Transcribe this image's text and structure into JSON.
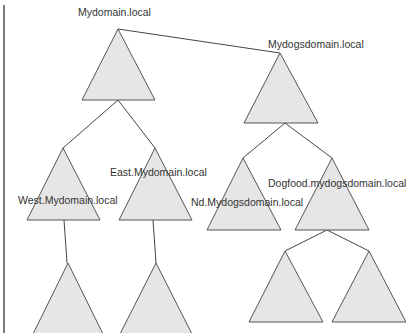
{
  "diagram": {
    "colors": {
      "triangle_fill": "#e6e6e6",
      "triangle_stroke": "#555555",
      "connector": "#444444",
      "text": "#333333"
    },
    "trees": [
      {
        "root": "Mydomain.local",
        "children": [
          {
            "name": "West.Mydomain.local",
            "children": [
              "(unlabeled child)"
            ]
          },
          {
            "name": "East.Mydomain.local",
            "children": [
              "(unlabeled child)"
            ]
          }
        ]
      },
      {
        "root": "Mydogsdomain.local",
        "children": [
          {
            "name": "Nd.Mydogsdomain.local",
            "children": []
          },
          {
            "name": "Dogfood.mydogsdomain.local",
            "children": [
              "(unlabeled child)",
              "(unlabeled child)"
            ]
          }
        ]
      }
    ],
    "labels": {
      "mydomain": "Mydomain.local",
      "mydogsdomain": "Mydogsdomain.local",
      "west": "West.Mydomain.local",
      "east": "East.Mydomain.local",
      "nd": "Nd.Mydogsdomain.local",
      "dogfood": "Dogfood.mydogsdomain.local"
    }
  }
}
